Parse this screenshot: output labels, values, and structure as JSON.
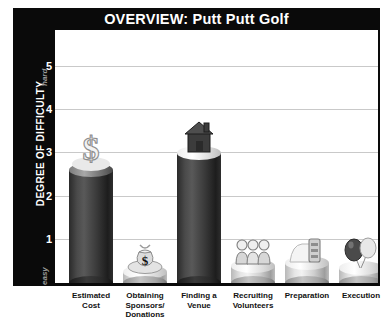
{
  "chart_data": {
    "type": "bar",
    "title": "OVERVIEW: Putt Putt Golf",
    "xlabel": "",
    "ylabel": "DEGREE OF DIFFICULTY",
    "ylim": [
      0,
      5.5
    ],
    "grid": true,
    "legend": "none",
    "y_axis_low_label": "easy",
    "y_axis_high_label": "hard",
    "tick_labels": [
      "1",
      "2",
      "3",
      "4",
      "5"
    ],
    "tick_values": [
      1,
      2,
      3,
      4,
      5
    ],
    "categories": [
      "Estimated Cost",
      "Obtaining Sponsors/ Donations",
      "Finding a Venue",
      "Recruiting Volunteers",
      "Preparation",
      "Execution"
    ],
    "values": [
      2.6,
      0.25,
      3.0,
      0.4,
      0.45,
      0.35
    ],
    "bar_icons": [
      "dollar-sign-icon",
      "money-bag-icon",
      "house-icon",
      "volunteers-group-icon",
      "supplies-icon",
      "balloons-icon"
    ],
    "bar_styles": [
      "dark",
      "light",
      "dark",
      "light",
      "light",
      "light"
    ]
  },
  "title": {
    "text": "OVERVIEW: Putt Putt Golf"
  },
  "axis": {
    "label": "DEGREE OF DIFFICULTY",
    "high": "hard",
    "low": "easy",
    "ticks": [
      "5",
      "4",
      "3",
      "2",
      "1"
    ]
  },
  "categories": [
    {
      "line1": "Estimated",
      "line2": "Cost",
      "line3": ""
    },
    {
      "line1": "Obtaining",
      "line2": "Sponsors/",
      "line3": "Donations"
    },
    {
      "line1": "Finding a",
      "line2": "Venue",
      "line3": ""
    },
    {
      "line1": "Recruiting",
      "line2": "Volunteers",
      "line3": ""
    },
    {
      "line1": "Preparation",
      "line2": "",
      "line3": ""
    },
    {
      "line1": "Execution",
      "line2": "",
      "line3": ""
    }
  ],
  "colors": {
    "frame": "#0a0a0a",
    "title_text": "#ffffff",
    "grid": "#c9c9c9",
    "axis_word": "#9a9a9a",
    "plot_bg": "#ffffff"
  }
}
